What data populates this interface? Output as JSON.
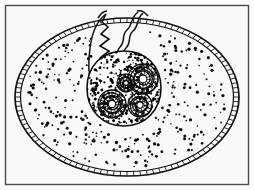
{
  "figure": {
    "title": "Ovoid cell with invaginated cleft and coiled internal organelles",
    "caption": "",
    "medium": "pen-and-ink line drawing, stippled",
    "has_text_labels": false,
    "color_mode": "monochrome"
  },
  "canvas": {
    "width": 254,
    "height": 190,
    "background_color": "#fbfbfa",
    "paper_color": "#fcfcfb"
  },
  "frame": {
    "name": "image-border",
    "x": 5,
    "y": 5,
    "width": 244,
    "height": 180,
    "stroke_color": "#4a4a4a",
    "stroke_width": 1.4,
    "fill_color": "#f9f9f8"
  },
  "ink": {
    "primary_color": "#111111",
    "dense_color": "#080808"
  },
  "structures": {
    "outer_membrane": {
      "name": "outer-membrane",
      "description": "ovoid double-walled cortex with transverse tick marks",
      "center_x": 127,
      "center_y": 97,
      "radius_x": 110,
      "radius_y": 78,
      "wall_thickness": 5,
      "tick_count": 104,
      "stroke_color": "#111111"
    },
    "cytoplasm": {
      "name": "cytoplasm",
      "description": "stippled interior field",
      "stipple_count": 300,
      "dot_radius_min": 0.7,
      "dot_radius_max": 1.7,
      "fill_color": "#fcfcfb"
    },
    "cleft": {
      "name": "invagination-cleft",
      "description": "notch opening at top centre where membrane folds inward",
      "opening_x_left": 106,
      "opening_x_right": 140,
      "opening_y": 12,
      "depth_y": 78,
      "left_edge_style": "sawtooth-zigzag",
      "right_edge_style": "wavy-double-line"
    },
    "central_mass": {
      "name": "central-mass",
      "description": "dark densely stippled rounded body containing coiled organelles",
      "center_x": 124,
      "center_y": 88,
      "radius": 37,
      "stipple_count": 420,
      "stroke_color": "#0d0d0d"
    },
    "coils": [
      {
        "name": "coil-upper-right",
        "cx": 143,
        "cy": 79,
        "outer_radius": 15,
        "turns": 3,
        "radial_marks": 22
      },
      {
        "name": "coil-lower-left",
        "cx": 112,
        "cy": 104,
        "outer_radius": 14,
        "turns": 3,
        "radial_marks": 20
      },
      {
        "name": "coil-lower-right",
        "cx": 140,
        "cy": 105,
        "outer_radius": 12,
        "turns": 2,
        "radial_marks": 18
      },
      {
        "name": "coil-centre",
        "cx": 126,
        "cy": 83,
        "outer_radius": 9,
        "turns": 2,
        "radial_marks": 14
      }
    ]
  }
}
